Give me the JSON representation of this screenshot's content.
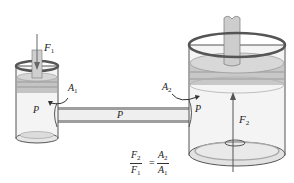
{
  "diagram": {
    "labels": {
      "force_small": {
        "symbol": "F",
        "sub": "1"
      },
      "force_large": {
        "symbol": "F",
        "sub": "2"
      },
      "area_small": {
        "symbol": "A",
        "sub": "1"
      },
      "area_large": {
        "symbol": "A",
        "sub": "2"
      },
      "pressure_small": "P",
      "pressure_tube": "P",
      "pressure_large": "P"
    },
    "equation": {
      "lhs_num": {
        "symbol": "F",
        "sub": "2"
      },
      "lhs_den": {
        "symbol": "F",
        "sub": "1"
      },
      "equals": "=",
      "rhs_num": {
        "symbol": "A",
        "sub": "2"
      },
      "rhs_den": {
        "symbol": "A",
        "sub": "1"
      }
    },
    "colors": {
      "outline": "#555555",
      "cylinder_fill": "#f2f2f2",
      "piston": "#bdbdbd",
      "rod": "#cfcfcf",
      "tube": "#d9d9d9"
    }
  }
}
